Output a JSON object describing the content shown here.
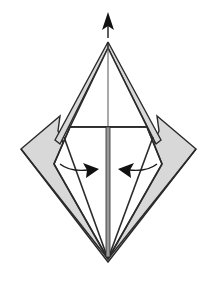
{
  "diagram": {
    "type": "origami-fold-step",
    "colors": {
      "line": "#2a2a2a",
      "shaded_paper": "#d8d8d8",
      "white_paper": "#ffffff",
      "arrow": "#111111"
    },
    "symbols": [
      {
        "name": "push-up-arrow",
        "direction": "up"
      },
      {
        "name": "fold-in-arrow-left",
        "direction": "right"
      },
      {
        "name": "fold-in-arrow-right",
        "direction": "left"
      }
    ]
  }
}
